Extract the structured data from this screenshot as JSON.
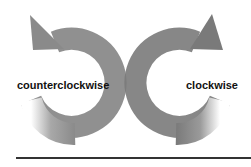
{
  "diagram": {
    "left_arrow": {
      "label": "counterclockwise",
      "direction": "counterclockwise",
      "color": "#8a8a8a"
    },
    "right_arrow": {
      "label": "clockwise",
      "direction": "clockwise",
      "color": "#7a7a7a"
    },
    "baseline_color": "#333333"
  }
}
